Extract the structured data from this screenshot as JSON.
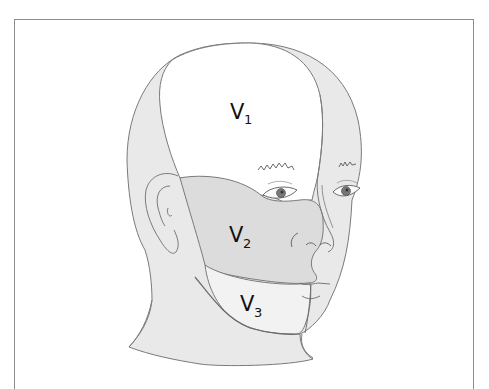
{
  "figure": {
    "regions": [
      {
        "id": "v1",
        "label": "V",
        "subscript": "1",
        "shade": "#ffffff"
      },
      {
        "id": "v2",
        "label": "V",
        "subscript": "2",
        "shade": "#dcdcdc"
      },
      {
        "id": "v3",
        "label": "V",
        "subscript": "3",
        "shade": "#f2f2f2"
      }
    ],
    "colors": {
      "outline": "#7a7a7a",
      "frame": "#8c8c8c",
      "skin_shade": "#e9e9e9",
      "v2_shade": "#dcdcdc"
    }
  }
}
